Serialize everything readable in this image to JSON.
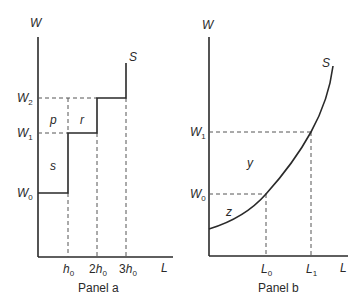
{
  "panel_a": {
    "caption": "Panel a",
    "y_axis_label": "W",
    "x_axis_label": "L",
    "curve_label": "S",
    "y_ticks": [
      {
        "base": "W",
        "sub": "2",
        "y": 98
      },
      {
        "base": "W",
        "sub": "1",
        "y": 133
      },
      {
        "base": "W",
        "sub": "0",
        "y": 193
      }
    ],
    "x_ticks": [
      {
        "base": "h",
        "prefix": "",
        "sub": "0",
        "x": 68
      },
      {
        "base": "h",
        "prefix": "2",
        "sub": "0",
        "x": 97
      },
      {
        "base": "h",
        "prefix": "3",
        "sub": "0",
        "x": 126
      }
    ],
    "region_labels": [
      {
        "text": "p",
        "x": 53,
        "y": 120
      },
      {
        "text": "r",
        "x": 82,
        "y": 120
      },
      {
        "text": "s",
        "x": 53,
        "y": 167
      }
    ]
  },
  "panel_b": {
    "caption": "Panel b",
    "y_axis_label": "W",
    "x_axis_label": "L",
    "curve_label": "S",
    "y_ticks": [
      {
        "base": "W",
        "sub": "1",
        "y": 132
      },
      {
        "base": "W",
        "sub": "0",
        "y": 194
      }
    ],
    "x_ticks": [
      {
        "base": "L",
        "sub": "0",
        "x": 266
      },
      {
        "base": "L",
        "sub": "1",
        "x": 311
      }
    ],
    "region_labels": [
      {
        "text": "y",
        "x": 250,
        "y": 163
      },
      {
        "text": "z",
        "x": 228,
        "y": 213
      }
    ]
  }
}
